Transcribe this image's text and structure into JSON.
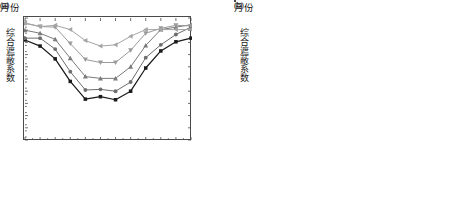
{
  "figure": {
    "background": "#ffffff",
    "panels": [
      "a",
      "b"
    ]
  },
  "panel_a": {
    "caption": "(a)",
    "xlabel": "月份",
    "ylabel": "综合遮蔽系数",
    "ytick_labels": [
      "0.0",
      "0.1",
      "0.2",
      "0.3",
      "0.4",
      "0.5",
      "0.6",
      "0.7",
      "0.8",
      "0.9",
      "1.0"
    ],
    "xtick_labels": [
      "1",
      "2",
      "3",
      "4",
      "5",
      "6",
      "7",
      "8",
      "9",
      "10",
      "11",
      "12"
    ]
  },
  "panel_b": {
    "caption": "(b)",
    "xlabel": "月份",
    "ylabel": "综合遮蔽系数",
    "ytick_labels": [
      "0.0",
      "0.1",
      "0.2",
      "0.3",
      "0.4",
      "0.5",
      "0.6",
      "0.7",
      "0.8",
      "0.9",
      "1.0"
    ],
    "xtick_labels": [
      "1",
      "2",
      "3",
      "4",
      "5",
      "6",
      "7",
      "8",
      "9",
      "10",
      "11",
      "12"
    ]
  },
  "legend_a": {
    "items": [
      {
        "label": "0°",
        "marker": "square",
        "color": "#1a1a1a"
      },
      {
        "label": "15°",
        "marker": "circle",
        "color": "#6e6e6e"
      },
      {
        "label": "30°",
        "marker": "triangle-up",
        "color": "#7b7b7b"
      },
      {
        "label": "45°",
        "marker": "triangle-down",
        "color": "#9a9a9a"
      },
      {
        "label": "60°",
        "marker": "triangle-left",
        "color": "#a5a5a5"
      }
    ]
  },
  "legend_b": {
    "items": [
      {
        "label": "75°",
        "marker": "square",
        "color": "#1a1a1a"
      },
      {
        "label": "90°",
        "marker": "circle",
        "color": "#6e6e6e"
      },
      {
        "label": "105°",
        "marker": "triangle-up",
        "color": "#7b7b7b"
      },
      {
        "label": "120°",
        "marker": "triangle-down",
        "color": "#9a9a9a"
      },
      {
        "label": "135°",
        "marker": "triangle-left",
        "color": "#a0a0a0"
      },
      {
        "label": "150°",
        "marker": "triangle-right",
        "color": "#ababab"
      }
    ]
  },
  "chart_data": [
    {
      "type": "line",
      "panel": "a",
      "title": "(a)",
      "xlabel": "月份",
      "ylabel": "综合遮蔽系数",
      "x": [
        1,
        2,
        3,
        4,
        5,
        6,
        7,
        8,
        9,
        10,
        11,
        12
      ],
      "xlim": [
        1,
        12
      ],
      "ylim": [
        0.0,
        1.0
      ],
      "yticks": [
        0.0,
        0.1,
        0.2,
        0.3,
        0.4,
        0.5,
        0.6,
        0.7,
        0.8,
        0.9,
        1.0
      ],
      "grid": false,
      "legend_position": "right-inside",
      "series": [
        {
          "name": "0°",
          "marker": "square",
          "color": "#1a1a1a",
          "values": [
            0.82,
            0.77,
            0.665,
            0.48,
            0.335,
            0.355,
            0.33,
            0.4,
            0.59,
            0.73,
            0.805,
            0.835
          ]
        },
        {
          "name": "15°",
          "marker": "circle",
          "color": "#6e6e6e",
          "values": [
            0.835,
            0.835,
            0.745,
            0.56,
            0.41,
            0.415,
            0.4,
            0.475,
            0.675,
            0.78,
            0.865,
            0.925
          ]
        },
        {
          "name": "30°",
          "marker": "triangle-up",
          "color": "#7b7b7b",
          "values": [
            0.9,
            0.875,
            0.825,
            0.67,
            0.52,
            0.505,
            0.505,
            0.6,
            0.775,
            0.905,
            0.925,
            0.945
          ]
        },
        {
          "name": "45°",
          "marker": "triangle-down",
          "color": "#9a9a9a",
          "values": [
            0.955,
            0.93,
            0.925,
            0.79,
            0.66,
            0.635,
            0.635,
            0.735,
            0.875,
            0.915,
            0.94,
            0.935
          ]
        },
        {
          "name": "60°",
          "marker": "triangle-left",
          "color": "#a5a5a5",
          "values": [
            0.96,
            0.93,
            0.94,
            0.905,
            0.815,
            0.77,
            0.78,
            0.85,
            0.905,
            0.905,
            0.905,
            0.905
          ]
        }
      ]
    },
    {
      "type": "line",
      "panel": "b",
      "title": "(b)",
      "xlabel": "月份",
      "ylabel": "综合遮蔽系数",
      "x": [
        1,
        2,
        3,
        4,
        5,
        6,
        7,
        8,
        9,
        10,
        11,
        12
      ],
      "xlim": [
        1,
        12
      ],
      "ylim": [
        0.0,
        1.0
      ],
      "yticks": [
        0.0,
        0.1,
        0.2,
        0.3,
        0.4,
        0.5,
        0.6,
        0.7,
        0.8,
        0.9,
        1.0
      ],
      "grid": false,
      "legend_position": "right-inside",
      "series": [
        {
          "name": "75°",
          "marker": "square",
          "color": "#1a1a1a",
          "values": [
            0.825,
            0.775,
            0.78,
            0.84,
            0.9,
            0.92,
            0.915,
            0.87,
            0.8,
            0.765,
            0.8,
            0.835
          ]
        },
        {
          "name": "90°",
          "marker": "circle",
          "color": "#6e6e6e",
          "values": [
            0.825,
            0.775,
            0.71,
            0.715,
            0.745,
            0.785,
            0.76,
            0.72,
            0.705,
            0.73,
            0.8,
            0.835
          ]
        },
        {
          "name": "105°",
          "marker": "triangle-up",
          "color": "#7b7b7b",
          "values": [
            0.825,
            0.775,
            0.665,
            0.6,
            0.6,
            0.65,
            0.62,
            0.59,
            0.615,
            0.73,
            0.8,
            0.835
          ]
        },
        {
          "name": "120°",
          "marker": "triangle-down",
          "color": "#9a9a9a",
          "values": [
            0.825,
            0.775,
            0.665,
            0.505,
            0.46,
            0.525,
            0.49,
            0.475,
            0.6,
            0.73,
            0.8,
            0.835
          ]
        },
        {
          "name": "135°",
          "marker": "triangle-left",
          "color": "#a0a0a0",
          "values": [
            0.825,
            0.775,
            0.665,
            0.49,
            0.375,
            0.425,
            0.395,
            0.41,
            0.595,
            0.73,
            0.8,
            0.835
          ]
        },
        {
          "name": "150°",
          "marker": "triangle-right",
          "color": "#ababab",
          "values": [
            0.825,
            0.775,
            0.665,
            0.485,
            0.34,
            0.36,
            0.335,
            0.405,
            0.595,
            0.73,
            0.8,
            0.835
          ]
        }
      ]
    }
  ]
}
